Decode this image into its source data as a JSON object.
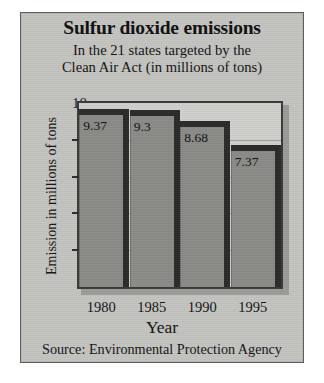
{
  "figure": {
    "title": "Sulfur dioxide emissions",
    "subtitle_line1": "In the 21 states targeted by the",
    "subtitle_line2": "Clean Air Act (in millions of tons)",
    "source": "Source: Environmental Protection Agency",
    "background_color": "#c3c3c0",
    "plot_background_color": "#cfcfcc",
    "bar_color": "#8a8a87",
    "bar_shadow_color": "#2b2b29",
    "text_color": "#131313"
  },
  "chart_data": {
    "type": "bar",
    "title": "Sulfur dioxide emissions",
    "subtitle": "In the 21 states targeted by the Clean Air Act (in millions of tons)",
    "categories": [
      "1980",
      "1985",
      "1990",
      "1995"
    ],
    "values": [
      9.37,
      9.3,
      8.68,
      7.37
    ],
    "data_labels": [
      "9.37",
      "9.3",
      "8.68",
      "7.37"
    ],
    "xlabel": "Year",
    "ylabel": "Emission in millions of tons",
    "ylim": [
      0,
      10
    ],
    "yticks": [
      2,
      4,
      6,
      8,
      10
    ],
    "ytick_labels": [
      "2",
      "4",
      "6",
      "8",
      "10"
    ],
    "grid": true,
    "legend": false,
    "source": "Source: Environmental Protection Agency"
  }
}
